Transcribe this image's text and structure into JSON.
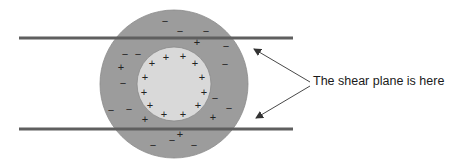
{
  "diagram": {
    "colors": {
      "outer_layer": "#9c9c9c",
      "inner_particle": "#d9d9d9",
      "shear_plane_bars": "#5f5f5f",
      "arrows": "#333333",
      "signs": "#222222"
    },
    "label": "The shear plane is here",
    "outer_layer_charges": {
      "minus": [
        [
          165,
          21
        ],
        [
          180,
          31
        ],
        [
          206,
          31
        ],
        [
          226,
          46
        ],
        [
          138,
          54
        ],
        [
          125,
          54
        ],
        [
          225,
          64
        ],
        [
          123,
          83
        ],
        [
          215,
          98
        ],
        [
          111,
          110
        ],
        [
          129,
          109
        ],
        [
          229,
          108
        ],
        [
          153,
          145
        ],
        [
          172,
          140
        ],
        [
          194,
          145
        ]
      ],
      "plus": [
        [
          197,
          42
        ],
        [
          121,
          67
        ],
        [
          145,
          119
        ],
        [
          213,
          117
        ],
        [
          180,
          134
        ]
      ]
    },
    "inner_particle_charges": {
      "plus": [
        [
          152,
          63
        ],
        [
          166,
          57
        ],
        [
          183,
          56
        ],
        [
          195,
          63
        ],
        [
          145,
          77
        ],
        [
          202,
          77
        ],
        [
          144,
          92
        ],
        [
          204,
          92
        ],
        [
          150,
          105
        ],
        [
          198,
          105
        ],
        [
          164,
          114
        ],
        [
          183,
          114
        ]
      ]
    },
    "signs": {
      "plus": "+",
      "minus": "−"
    }
  }
}
